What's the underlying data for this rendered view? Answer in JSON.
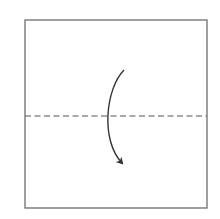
{
  "diagram": {
    "type": "origami-fold-step",
    "paper": {
      "x": 25,
      "y": 20,
      "width": 182,
      "height": 188,
      "stroke": "#6e6e6e",
      "fill": "#ffffff"
    },
    "fold_line": {
      "style": "dashed",
      "y": 116,
      "x1": 25,
      "x2": 207,
      "stroke": "#555555",
      "dash": "6 3.5"
    },
    "arrow": {
      "direction": "down",
      "start": [
        124,
        70
      ],
      "control1": [
        106,
        88
      ],
      "control2": [
        100,
        140
      ],
      "end": [
        122,
        163
      ],
      "stroke": "#333333"
    }
  }
}
